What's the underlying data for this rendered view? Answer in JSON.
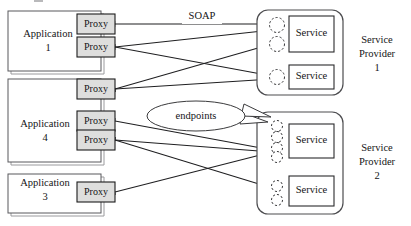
{
  "figure": {
    "type": "diagram"
  },
  "applications": [
    {
      "id": "application-1",
      "label_line1": "Application",
      "label_line2": "1",
      "proxies": [
        {
          "id": "app1-proxy-1",
          "label": "Proxy"
        },
        {
          "id": "app1-proxy-2",
          "label": "Proxy"
        }
      ]
    },
    {
      "id": "application-4",
      "label_line1": "Application",
      "label_line2": "4",
      "proxies": [
        {
          "id": "app4-proxy-1",
          "label": "Proxy"
        },
        {
          "id": "app4-proxy-2",
          "label": "Proxy"
        },
        {
          "id": "app4-proxy-3",
          "label": "Proxy"
        }
      ]
    },
    {
      "id": "application-3",
      "label_line1": "Application",
      "label_line2": "3",
      "proxies": [
        {
          "id": "app3-proxy-1",
          "label": "Proxy"
        }
      ]
    }
  ],
  "providers": [
    {
      "id": "service-provider-1",
      "label_line1": "Service",
      "label_line2": "Provider",
      "label_line3": "1",
      "services": [
        {
          "id": "sp1-service-1",
          "label": "Service",
          "endpoint_count": 2
        },
        {
          "id": "sp1-service-2",
          "label": "Service",
          "endpoint_count": 1
        }
      ]
    },
    {
      "id": "service-provider-2",
      "label_line1": "Service",
      "label_line2": "Provider",
      "label_line3": "2",
      "services": [
        {
          "id": "sp2-service-1",
          "label": "Service",
          "endpoint_count": 4
        },
        {
          "id": "sp2-service-2",
          "label": "Service",
          "endpoint_count": 2
        }
      ]
    }
  ],
  "annotations": {
    "soap_label": "SOAP",
    "endpoints_label": "endpoints"
  },
  "colors": {
    "proxy_fill": "#dededd",
    "line": "#1f1f21",
    "box_stroke": "#2a2a2c",
    "background": "#ffffff"
  }
}
